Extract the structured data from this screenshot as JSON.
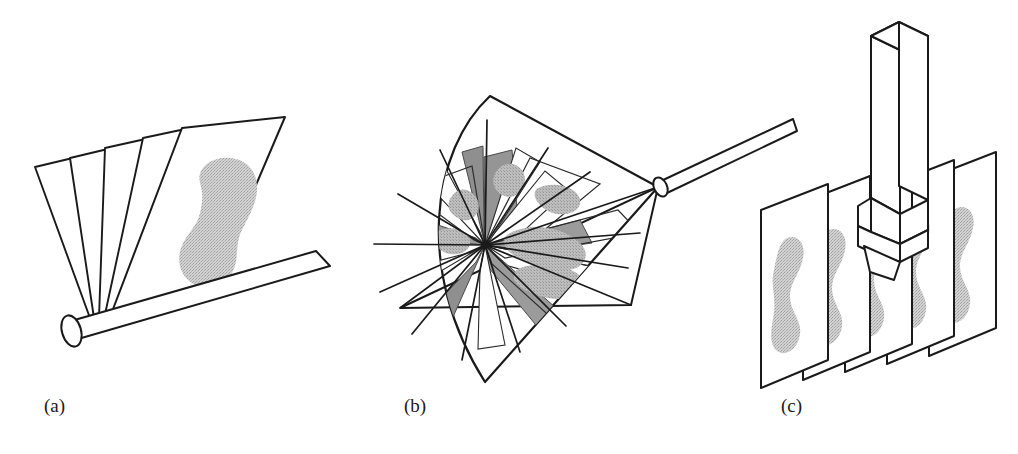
{
  "figure": {
    "background_color": "#ffffff",
    "line_color": "#1a1a1a",
    "tissue_fill_color": "#c9c9c9",
    "plane_shade_color": "#999999",
    "plane_light_color": "#e8e8e8",
    "panel_count": 3
  },
  "panels": [
    {
      "id": "a",
      "label": "(a)",
      "name": "tilt-fan-scan",
      "description": "Tilting scan: planar slices fan out from a common rotation axis located on a cylindrical rod",
      "slice_count": 5,
      "axis_type": "cylindrical-rod",
      "tissue_label": "tissue-blob-a"
    },
    {
      "id": "b",
      "label": "(b)",
      "name": "rotational-cone-scan",
      "description": "Rotational scan: slices rotate about a central axis sweeping out a conical volume",
      "slice_count": 12,
      "axis_type": "probe-rod-apex",
      "envelope": "cone-with-spherical-cap",
      "tissue_label": "tissue-blob-b"
    },
    {
      "id": "c",
      "label": "(c)",
      "name": "linear-translation-scan",
      "description": "Linear scan: probe translated to acquire a stack of parallel slices",
      "slice_count": 5,
      "axis_type": "linear-probe",
      "tissue_label": "tissue-blob-c"
    }
  ],
  "labels": {
    "a": "(a)",
    "b": "(b)",
    "c": "(c)"
  },
  "label_positions": {
    "a": {
      "x": 44,
      "y": 412
    },
    "b": {
      "x": 404,
      "y": 412
    },
    "c": {
      "x": 781,
      "y": 412
    }
  }
}
